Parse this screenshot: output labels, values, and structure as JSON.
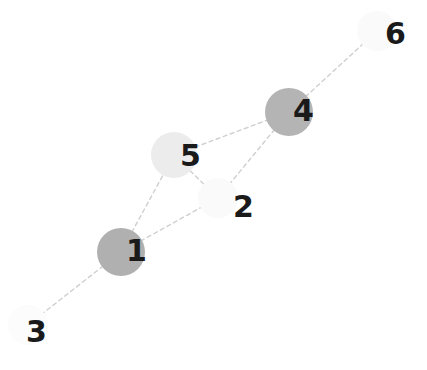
{
  "graph": {
    "title": "Undirected node-link network diagram",
    "background_color": "#ffffff",
    "label_color": "#1a1a1a",
    "edge_color": "#cfcfcf",
    "edge_style": "dashed",
    "node_count": 6,
    "edge_count": 7,
    "nodes": [
      {
        "id": "1",
        "label": "1",
        "cx": 121,
        "cy": 252,
        "r": 24,
        "fill": "#b0b0b0",
        "label_x": 126,
        "label_y": 236,
        "font_size": 30
      },
      {
        "id": "2",
        "label": "2",
        "cx": 218,
        "cy": 198,
        "r": 20,
        "fill": "#fafafa",
        "label_x": 233,
        "label_y": 192,
        "font_size": 30
      },
      {
        "id": "3",
        "label": "3",
        "cx": 28,
        "cy": 325,
        "r": 20,
        "fill": "#fcfcfc",
        "label_x": 26,
        "label_y": 317,
        "font_size": 30
      },
      {
        "id": "4",
        "label": "4",
        "cx": 289,
        "cy": 112,
        "r": 24,
        "fill": "#b4b4b4",
        "label_x": 293,
        "label_y": 96,
        "font_size": 30
      },
      {
        "id": "5",
        "label": "5",
        "cx": 174,
        "cy": 155,
        "r": 23,
        "fill": "#ececec",
        "label_x": 180,
        "label_y": 141,
        "font_size": 30
      },
      {
        "id": "6",
        "label": "6",
        "cx": 377,
        "cy": 31,
        "r": 20,
        "fill": "#fafafa",
        "label_x": 385,
        "label_y": 19,
        "font_size": 30
      }
    ],
    "edges": [
      {
        "id": "edge-1-3",
        "source": "1",
        "target": "3",
        "x1": 121,
        "y1": 252,
        "x2": 28,
        "y2": 325
      },
      {
        "id": "edge-1-5",
        "source": "1",
        "target": "5",
        "x1": 121,
        "y1": 252,
        "x2": 174,
        "y2": 155
      },
      {
        "id": "edge-1-2",
        "source": "1",
        "target": "2",
        "x1": 121,
        "y1": 252,
        "x2": 218,
        "y2": 198
      },
      {
        "id": "edge-5-2",
        "source": "5",
        "target": "2",
        "x1": 174,
        "y1": 155,
        "x2": 218,
        "y2": 198
      },
      {
        "id": "edge-5-4",
        "source": "5",
        "target": "4",
        "x1": 174,
        "y1": 155,
        "x2": 289,
        "y2": 112
      },
      {
        "id": "edge-4-2",
        "source": "4",
        "target": "2",
        "x1": 289,
        "y1": 112,
        "x2": 218,
        "y2": 198
      },
      {
        "id": "edge-4-6",
        "source": "4",
        "target": "6",
        "x1": 289,
        "y1": 112,
        "x2": 377,
        "y2": 31
      }
    ]
  }
}
